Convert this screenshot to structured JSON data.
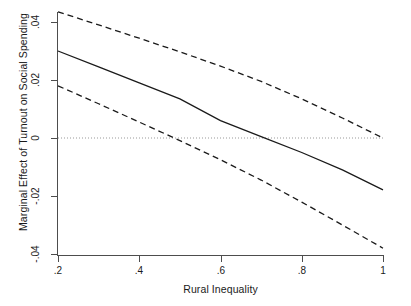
{
  "chart_data": {
    "type": "line",
    "title": "",
    "subtitle": "",
    "xlabel": "Rural Inequality",
    "ylabel": "Marginal Effect of Turnout on Social Spending",
    "xlim": [
      0.2,
      1.0
    ],
    "ylim": [
      -0.04,
      0.04
    ],
    "xticks": [
      0.2,
      0.4,
      0.6,
      0.8,
      1.0
    ],
    "xticklabels": [
      ".2",
      ".4",
      ".6",
      ".8",
      "1"
    ],
    "yticks": [
      0.04,
      0.02,
      0,
      -0.02,
      -0.04
    ],
    "yticklabels": [
      ".04",
      ".02",
      "0",
      "-.02",
      "-.04"
    ],
    "grid": false,
    "legend": null,
    "zero_reference_line": {
      "value": 0,
      "style": "dotted",
      "color": "#999999"
    },
    "series": [
      {
        "name": "Upper 95% confidence bound",
        "style": "dashed",
        "color": "#1a1a1a",
        "x": [
          0.2,
          0.3,
          0.4,
          0.5,
          0.6,
          0.7,
          0.8,
          0.9,
          1.0
        ],
        "values": [
          0.0435,
          0.039,
          0.0344,
          0.0297,
          0.0248,
          0.0195,
          0.0135,
          0.0069,
          0.0
        ]
      },
      {
        "name": "Marginal effect (point estimate)",
        "style": "solid",
        "color": "#1a1a1a",
        "x": [
          0.2,
          0.3,
          0.4,
          0.5,
          0.6,
          0.7,
          0.8,
          0.9,
          1.0
        ],
        "values": [
          0.03,
          0.0245,
          0.019,
          0.0135,
          0.006,
          0.0005,
          -0.005,
          -0.011,
          -0.0179
        ]
      },
      {
        "name": "Lower 95% confidence bound",
        "style": "dashed",
        "color": "#1a1a1a",
        "x": [
          0.2,
          0.3,
          0.4,
          0.5,
          0.6,
          0.7,
          0.8,
          0.9,
          1.0
        ],
        "values": [
          0.018,
          0.0118,
          0.0055,
          -0.0009,
          -0.0075,
          -0.0145,
          -0.0221,
          -0.03,
          -0.038
        ]
      }
    ]
  },
  "axes": {
    "x_title": "Rural Inequality",
    "y_title": "Marginal Effect of Turnout on Social Spending",
    "x_ticks": [
      {
        "label": ".2",
        "value": 0.2
      },
      {
        "label": ".4",
        "value": 0.4
      },
      {
        "label": ".6",
        "value": 0.6
      },
      {
        "label": ".8",
        "value": 0.8
      },
      {
        "label": "1",
        "value": 1.0
      }
    ],
    "y_ticks": [
      {
        "label": ".04",
        "value": 0.04
      },
      {
        "label": ".02",
        "value": 0.02
      },
      {
        "label": "0",
        "value": 0
      },
      {
        "label": "-.02",
        "value": -0.02
      },
      {
        "label": "-.04",
        "value": -0.04
      }
    ]
  },
  "colors": {
    "line": "#1a1a1a",
    "axis": "#4d4d4d",
    "zero_line": "#999999",
    "background": "#ffffff"
  }
}
